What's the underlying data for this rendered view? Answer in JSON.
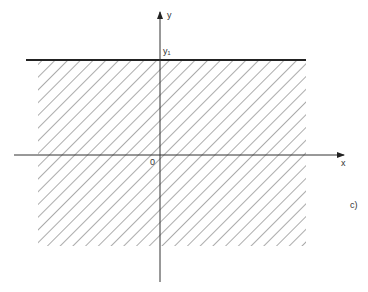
{
  "figure": {
    "y_axis_label": "y",
    "x_axis_label": "x",
    "origin_label": "0",
    "line_label": "y₁",
    "panel_label": "c)",
    "caption": "",
    "colors": {
      "axis": "#333333",
      "hatch": "#555555",
      "boundary": "#222222"
    }
  }
}
